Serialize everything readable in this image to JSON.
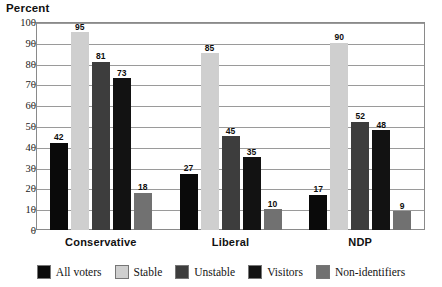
{
  "chart_data": {
    "type": "bar",
    "title": "Percent",
    "xlabel": "",
    "ylabel": "Percent",
    "ylim": [
      0,
      100
    ],
    "ytick_step": 10,
    "yticks": [
      100,
      90,
      80,
      70,
      60,
      50,
      40,
      30,
      20,
      10,
      0
    ],
    "grid": true,
    "legend_position": "bottom",
    "categories": [
      "Conservative",
      "Liberal",
      "NDP"
    ],
    "series": [
      {
        "name": "All voters",
        "color": "#0a0a0a",
        "values": [
          42,
          27,
          17
        ]
      },
      {
        "name": "Stable",
        "color": "#cfcfcf",
        "values": [
          95,
          85,
          90
        ]
      },
      {
        "name": "Unstable",
        "color": "#3d3d3d",
        "values": [
          81,
          45,
          52
        ]
      },
      {
        "name": "Visitors",
        "color": "#121212",
        "values": [
          73,
          35,
          48
        ]
      },
      {
        "name": "Non-identifiers",
        "color": "#717171",
        "values": [
          18,
          10,
          9
        ]
      }
    ]
  },
  "legend": {
    "items": [
      {
        "label": "All voters"
      },
      {
        "label": "Stable"
      },
      {
        "label": "Unstable"
      },
      {
        "label": "Visitors"
      },
      {
        "label": "Non-identifiers"
      }
    ]
  }
}
